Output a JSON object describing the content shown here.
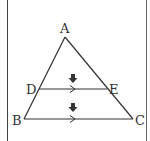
{
  "diagram": {
    "type": "geometry-triangle-midline",
    "points": {
      "A": {
        "label": "A",
        "x": 65,
        "y": 37
      },
      "B": {
        "label": "B",
        "x": 24,
        "y": 119
      },
      "C": {
        "label": "C",
        "x": 133,
        "y": 119
      },
      "D": {
        "label": "D",
        "x": 39,
        "y": 89
      },
      "E": {
        "label": "E",
        "x": 107,
        "y": 89
      }
    },
    "segments": [
      "AB",
      "AC",
      "BC",
      "DE"
    ],
    "parallel_marks": [
      "DE",
      "BC"
    ],
    "down_arrows": 2,
    "colors": {
      "line": "#333333",
      "arrow": "#333333",
      "border": "#444444"
    }
  }
}
